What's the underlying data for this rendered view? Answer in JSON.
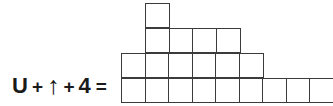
{
  "equation": {
    "terms": [
      {
        "kind": "letter",
        "text": "U"
      },
      {
        "kind": "operator",
        "text": "+"
      },
      {
        "kind": "arrow",
        "text": "↑",
        "icon": "up-arrow-icon"
      },
      {
        "kind": "operator",
        "text": "+"
      },
      {
        "kind": "number",
        "text": "4"
      },
      {
        "kind": "equals",
        "text": "="
      }
    ],
    "full_text": "U + ↑ + 4 ="
  },
  "figure": {
    "type": "unit-square-staircase",
    "cell_size_px": 25,
    "line_color": "#3b3b3b",
    "fill_color": "#ffffff",
    "rows": [
      {
        "name": "row-top",
        "cells": 1,
        "offset_cells": 1
      },
      {
        "name": "row-upper-middle",
        "cells": 4,
        "offset_cells": 1
      },
      {
        "name": "row-lower-middle",
        "cells": 6,
        "offset_cells": 0
      },
      {
        "name": "row-bottom",
        "cells": 9,
        "offset_cells": 0
      }
    ],
    "total_cells": 20
  },
  "chart_data": {
    "type": "bar",
    "title": "",
    "xlabel": "",
    "ylabel": "",
    "categories": [
      "1",
      "2",
      "3",
      "4",
      "5",
      "6",
      "7",
      "8",
      "9"
    ],
    "values": [
      2,
      4,
      3,
      3,
      3,
      2,
      1,
      1,
      1
    ],
    "ylim": [
      0,
      4
    ],
    "grid": true,
    "legend": null,
    "annotations": [
      "U + ↑ + 4 ="
    ]
  }
}
